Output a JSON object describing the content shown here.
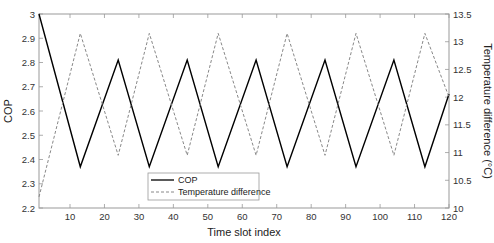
{
  "chart_data": {
    "type": "line",
    "title": "",
    "xlabel": "Time slot index",
    "ylabel_left": "COP",
    "ylabel_right": "Temperature difference (°C)",
    "xlim": [
      1,
      120
    ],
    "ylim_left": [
      2.2,
      3.0
    ],
    "ylim_right": [
      10,
      13.5
    ],
    "x_ticks": [
      10,
      20,
      30,
      40,
      50,
      60,
      70,
      80,
      90,
      100,
      110,
      120
    ],
    "y_ticks_left": [
      "2.2",
      "2.3",
      "2.4",
      "2.5",
      "2.6",
      "2.7",
      "2.8",
      "2.9",
      "3"
    ],
    "y_ticks_right": [
      "10",
      "10.5",
      "11",
      "11.5",
      "12",
      "12.5",
      "13",
      "13.5"
    ],
    "grid": false,
    "legend_position": "lower center",
    "series": [
      {
        "name": "COP",
        "axis": "left",
        "style": "solid",
        "color": "#000000",
        "x": [
          1,
          13,
          24,
          33,
          44,
          53,
          64,
          73,
          84,
          93,
          104,
          113,
          120
        ],
        "values": [
          3.0,
          2.37,
          2.81,
          2.37,
          2.81,
          2.37,
          2.81,
          2.37,
          2.81,
          2.37,
          2.81,
          2.37,
          2.67
        ]
      },
      {
        "name": "Temperature difference",
        "axis": "right",
        "style": "dashed",
        "color": "#888888",
        "x": [
          1,
          13,
          24,
          33,
          44,
          53,
          64,
          73,
          84,
          93,
          104,
          113,
          120
        ],
        "values": [
          10.2,
          13.15,
          10.95,
          13.15,
          10.95,
          13.15,
          10.95,
          13.15,
          10.95,
          13.15,
          10.95,
          13.15,
          12.0
        ]
      }
    ]
  },
  "legend": {
    "items": [
      {
        "label": "COP"
      },
      {
        "label": "Temperature difference"
      }
    ]
  },
  "axes": {
    "xlabel": "Time slot index",
    "ylabel_left": "COP",
    "ylabel_right": "Temperature difference (°C)"
  }
}
